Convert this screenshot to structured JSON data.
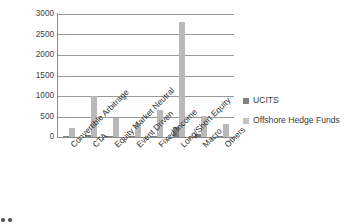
{
  "chart_data": {
    "type": "bar",
    "title": "",
    "subtitle": "",
    "xlabel": "",
    "ylabel": "",
    "ylim": [
      0,
      3000
    ],
    "ytick_labels": [
      "3000",
      "2500",
      "2000",
      "1500",
      "1000",
      "500",
      "0"
    ],
    "yticks": [
      3000,
      2500,
      2000,
      1500,
      1000,
      500,
      0
    ],
    "grid": true,
    "legend_position": "right",
    "categories": [
      "Convertible Arbitrage",
      "CTA",
      "Equity Market Neutral",
      "Event Driven",
      "Fixed Income",
      "Long/Short Equity",
      "Macro",
      "Others"
    ],
    "series": [
      {
        "name": "UCITS",
        "color": "#808080",
        "values": [
          5,
          40,
          15,
          5,
          20,
          240,
          70,
          5
        ]
      },
      {
        "name": "Offshore Hedge Funds",
        "color": "#b9b9b9",
        "values": [
          230,
          990,
          470,
          350,
          650,
          2800,
          520,
          310
        ]
      }
    ]
  },
  "legend": {
    "items": [
      {
        "label": "UCITS",
        "swatch": "ucits"
      },
      {
        "label": "Offshore Hedge Funds",
        "swatch": "offshore"
      }
    ]
  }
}
